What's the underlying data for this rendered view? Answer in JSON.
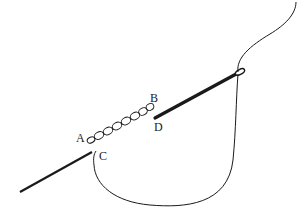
{
  "diagram": {
    "type": "embroidery-stitch-illustration",
    "labels": {
      "A": "A",
      "B": "B",
      "C": "C",
      "D": "D"
    },
    "elements": [
      {
        "name": "chain-stitches",
        "from": "A",
        "to": "B",
        "count": 8
      },
      {
        "name": "needle",
        "from": "D",
        "description": "needle passing under fabric, eye at upper right"
      },
      {
        "name": "thread",
        "description": "thread from needle eye loops down and back to point C"
      },
      {
        "name": "running-line",
        "from": "C",
        "description": "stitched line to lower left"
      }
    ],
    "colors": {
      "ink": "#1a1a1a",
      "background": "#ffffff"
    }
  }
}
